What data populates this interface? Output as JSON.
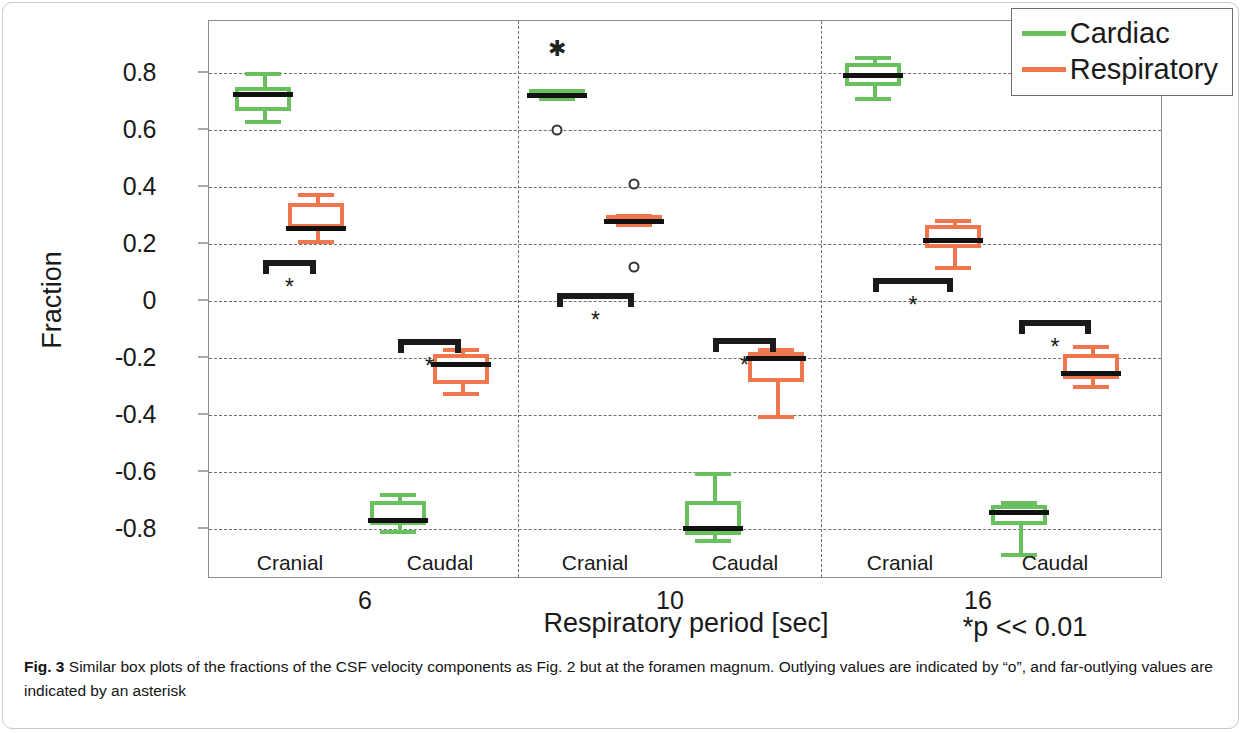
{
  "figure": {
    "caption_label": "Fig. 3",
    "caption_text": "Similar box plots of the fractions of the CSF velocity components as Fig. 2 but at the foramen magnum. Outlying values are indicated by “o”, and far-outlying values are indicated by an asterisk",
    "significance_note": "*p << 0.01"
  },
  "colors": {
    "cardiac": "#6ABF5E",
    "respiratory": "#F2764B",
    "median": "#111111",
    "grid": "#6e6e6e",
    "axis": "#8c8c8c"
  },
  "legend": {
    "position": "top-right",
    "entries": [
      {
        "label": "Cardiac",
        "color": "#6ABF5E"
      },
      {
        "label": "Respiratory",
        "color": "#F2764B"
      }
    ]
  },
  "chart_data": {
    "type": "box",
    "title": "",
    "xlabel": "Respiratory period [sec]",
    "ylabel": "Fraction",
    "ylim": [
      -0.95,
      0.95
    ],
    "yticks": [
      0.8,
      0.6,
      0.4,
      0.2,
      0,
      -0.2,
      -0.4,
      -0.6,
      -0.8
    ],
    "ytick_labels": [
      "0.8",
      "0.6",
      "0.4",
      "0.2",
      "0",
      "-0.2",
      "-0.4",
      "-0.6",
      "-0.8"
    ],
    "grid": "horizontal-dashed",
    "group_labels": [
      "6",
      "10",
      "16"
    ],
    "sub_labels": [
      "Cranial",
      "Caudal",
      "Cranial",
      "Caudal",
      "Cranial",
      "Caudal"
    ],
    "legend_entries": [
      "Cardiac",
      "Respiratory"
    ],
    "annotations": [
      "*p << 0.01"
    ],
    "boxes": [
      {
        "group": "6",
        "direction": "Cranial",
        "series": "Cardiac",
        "color": "#6ABF5E",
        "whisker_low": 0.635,
        "q1": 0.665,
        "median": 0.735,
        "q3": 0.75,
        "whisker_high": 0.805,
        "outliers_o": [],
        "outliers_star": []
      },
      {
        "group": "6",
        "direction": "Cranial",
        "series": "Respiratory",
        "color": "#F2764B",
        "whisker_low": 0.215,
        "q1": 0.255,
        "median": 0.263,
        "q3": 0.345,
        "whisker_high": 0.38,
        "outliers_o": [],
        "outliers_star": []
      },
      {
        "group": "6",
        "direction": "Caudal",
        "series": "Respiratory",
        "color": "#F2764B",
        "whisker_low": -0.32,
        "q1": -0.29,
        "median": -0.215,
        "q3": -0.185,
        "whisker_high": -0.165,
        "outliers_o": [],
        "outliers_star": []
      },
      {
        "group": "6",
        "direction": "Caudal",
        "series": "Cardiac",
        "color": "#6ABF5E",
        "whisker_low": -0.805,
        "q1": -0.785,
        "median": -0.762,
        "q3": -0.7,
        "whisker_high": -0.675,
        "outliers_o": [],
        "outliers_star": []
      },
      {
        "group": "10",
        "direction": "Cranial",
        "series": "Cardiac",
        "color": "#6ABF5E",
        "whisker_low": 0.715,
        "q1": 0.715,
        "median": 0.73,
        "q3": 0.745,
        "whisker_high": 0.745,
        "outliers_o": [
          0.6
        ],
        "outliers_star": [
          0.885
        ]
      },
      {
        "group": "10",
        "direction": "Cranial",
        "series": "Respiratory",
        "color": "#F2764B",
        "whisker_low": 0.272,
        "q1": 0.275,
        "median": 0.288,
        "q3": 0.302,
        "whisker_high": 0.305,
        "outliers_o": [
          0.41,
          0.12
        ],
        "outliers_star": []
      },
      {
        "group": "10",
        "direction": "Caudal",
        "series": "Respiratory",
        "color": "#F2764B",
        "whisker_low": -0.4,
        "q1": -0.285,
        "median": -0.192,
        "q3": -0.18,
        "whisker_high": -0.165,
        "outliers_o": [],
        "outliers_star": []
      },
      {
        "group": "10",
        "direction": "Caudal",
        "series": "Cardiac",
        "color": "#6ABF5E",
        "whisker_low": -0.835,
        "q1": -0.82,
        "median": -0.79,
        "q3": -0.7,
        "whisker_high": -0.6,
        "outliers_o": [],
        "outliers_star": []
      },
      {
        "group": "16",
        "direction": "Cranial",
        "series": "Cardiac",
        "color": "#6ABF5E",
        "whisker_low": 0.715,
        "q1": 0.755,
        "median": 0.8,
        "q3": 0.835,
        "whisker_high": 0.858,
        "outliers_o": [],
        "outliers_star": []
      },
      {
        "group": "16",
        "direction": "Cranial",
        "series": "Respiratory",
        "color": "#F2764B",
        "whisker_low": 0.122,
        "q1": 0.185,
        "median": 0.222,
        "q3": 0.265,
        "whisker_high": 0.288,
        "outliers_o": [],
        "outliers_star": []
      },
      {
        "group": "16",
        "direction": "Caudal",
        "series": "Respiratory",
        "color": "#F2764B",
        "whisker_low": -0.295,
        "q1": -0.275,
        "median": -0.245,
        "q3": -0.185,
        "whisker_high": -0.155,
        "outliers_o": [],
        "outliers_star": []
      },
      {
        "group": "16",
        "direction": "Caudal",
        "series": "Cardiac",
        "color": "#6ABF5E",
        "whisker_low": -0.885,
        "q1": -0.785,
        "median": -0.735,
        "q3": -0.715,
        "whisker_high": -0.7,
        "outliers_o": [],
        "outliers_star": []
      }
    ],
    "significance_brackets": [
      {
        "group": "6",
        "direction": "Cranial",
        "y": 0.145,
        "marker": "*"
      },
      {
        "group": "6",
        "direction": "Caudal",
        "y": -0.135,
        "marker": "*"
      },
      {
        "group": "10",
        "direction": "Cranial",
        "y": 0.028,
        "marker": "*"
      },
      {
        "group": "10",
        "direction": "Caudal",
        "y": -0.13,
        "marker": "*"
      },
      {
        "group": "16",
        "direction": "Cranial",
        "y": 0.08,
        "marker": "*"
      },
      {
        "group": "16",
        "direction": "Caudal",
        "y": -0.068,
        "marker": "*"
      }
    ]
  }
}
